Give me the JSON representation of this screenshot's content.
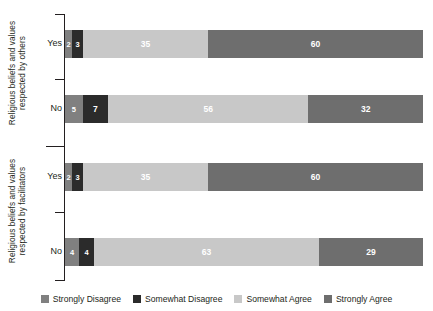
{
  "chart_data": {
    "type": "bar",
    "title": "",
    "subtitle": "",
    "orientation": "horizontal",
    "stacked": true,
    "stack_mode": "percent",
    "xlabel": "",
    "ylabel": "",
    "xlim": [
      0,
      100
    ],
    "grid": false,
    "legend_position": "bottom",
    "legend": [
      "Strongly Disagree",
      "Somewhat Disagree",
      "Somewhat Agree",
      "Strongly Agree"
    ],
    "colors": {
      "strongly_disagree": "#808080",
      "somewhat_disagree": "#2b2b2b",
      "somewhat_agree": "#c8c8c8",
      "strongly_agree": "#6e6e6e"
    },
    "groups": [
      {
        "label_line1": "Religious beliefs and values",
        "label_line2": "respected by others",
        "categories": [
          "Yes",
          "No"
        ],
        "rows": [
          {
            "category": "Yes",
            "values": [
              2,
              3,
              35,
              60
            ]
          },
          {
            "category": "No",
            "values": [
              5,
              7,
              56,
              32
            ]
          }
        ]
      },
      {
        "label_line1": "Religious beliefs and values",
        "label_line2": "respected by facilitators",
        "categories": [
          "Yes",
          "No"
        ],
        "rows": [
          {
            "category": "Yes",
            "values": [
              2,
              3,
              35,
              60
            ]
          },
          {
            "category": "No",
            "values": [
              4,
              4,
              63,
              29
            ]
          }
        ]
      }
    ],
    "series": [
      {
        "name": "Strongly Disagree",
        "values": [
          2,
          5,
          2,
          4
        ]
      },
      {
        "name": "Somewhat Disagree",
        "values": [
          3,
          7,
          3,
          4
        ]
      },
      {
        "name": "Somewhat Agree",
        "values": [
          35,
          56,
          35,
          63
        ]
      },
      {
        "name": "Strongly Agree",
        "values": [
          60,
          32,
          60,
          29
        ]
      }
    ],
    "row_order": [
      "others / Yes",
      "others / No",
      "facilitators / Yes",
      "facilitators / No"
    ]
  }
}
